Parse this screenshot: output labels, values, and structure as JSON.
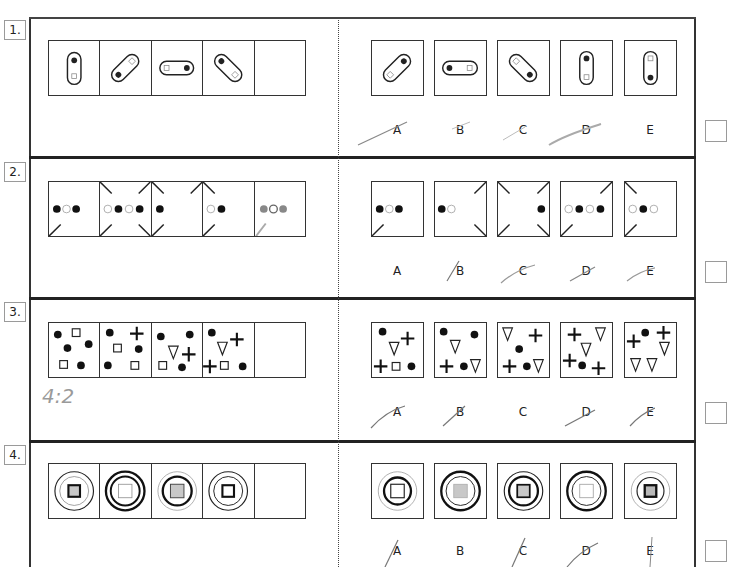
{
  "questions": [
    {
      "number": "1.",
      "sequence": [
        "capsule-vertical dot-top square-bottom",
        "capsule-diagonal-up dot-bottomleft square-topright",
        "capsule-horizontal square-left dot-right",
        "capsule-diagonal-down dot-topleft square-bottomright",
        "empty"
      ],
      "options": [
        {
          "label": "A",
          "figure": "capsule-diagonal-up dot-topright square-bottomleft",
          "crossed_out": true
        },
        {
          "label": "B",
          "figure": "capsule-horizontal dot-left square-right",
          "crossed_out": false
        },
        {
          "label": "C",
          "figure": "capsule-diagonal-down square-topleft dot-bottomright",
          "crossed_out": true
        },
        {
          "label": "D",
          "figure": "capsule-vertical dot-top square-bottom",
          "crossed_out": true
        },
        {
          "label": "E",
          "figure": "capsule-vertical square-top dot-bottom",
          "crossed_out": false
        }
      ],
      "answer": ""
    },
    {
      "number": "2.",
      "sequence": [
        "dots: filled-open-filled, corner ticks bottom-left",
        "dots: open-filled-open-filled, ticks top-left top-right bottom-left bottom-right",
        "dots: filled, ticks top-left top-right bottom-left",
        "dots: open-filled, ticks top-left bottom-left",
        "pencil: filled-open-filled (handwritten)"
      ],
      "options": [
        {
          "label": "A",
          "figure": "dots filled-open-filled, tick bottom-left",
          "crossed_out": false
        },
        {
          "label": "B",
          "figure": "dots filled-open, ticks top-right bottom-right",
          "crossed_out": true
        },
        {
          "label": "C",
          "figure": "dot filled right, ticks all four corners",
          "crossed_out": true
        },
        {
          "label": "D",
          "figure": "dots open-filled-open-filled, ticks top-right bottom-left",
          "crossed_out": true
        },
        {
          "label": "E",
          "figure": "dots open-filled-open, ticks top-left bottom-left",
          "crossed_out": true
        }
      ],
      "answer": ""
    },
    {
      "number": "3.",
      "handwritten_note": "4:2",
      "sequence": [
        "circles x4, squares x2",
        "circles x3, square x2, cross x1",
        "circles x3, triangle x1, cross x1, square x1",
        "circles x2, triangle x1, cross x2, square x1",
        "empty"
      ],
      "options": [
        {
          "label": "A",
          "figure": "circles x2, cross x2, triangle x1, square x1",
          "crossed_out": true
        },
        {
          "label": "B",
          "figure": "circles x3, triangles x2, cross x1",
          "crossed_out": true
        },
        {
          "label": "C",
          "figure": "triangles x2, crosses x2, circles x2",
          "crossed_out": false
        },
        {
          "label": "D",
          "figure": "crosses x3, triangles x2, circle x1",
          "crossed_out": true
        },
        {
          "label": "E",
          "figure": "crosses x2, triangles x3, circle x1",
          "crossed_out": true
        }
      ],
      "answer": ""
    },
    {
      "number": "4.",
      "sequence": [
        "thin outer ring, thin inner ring, grey square thick border",
        "thick outer ring, thick inner ring, white square thin border",
        "thin outer ring, thick inner ring, grey square thin border",
        "thick outer ring, thin inner ring, white square thick border",
        "empty"
      ],
      "options": [
        {
          "label": "A",
          "figure": "thin outer, thick inner, white square thin",
          "crossed_out": true
        },
        {
          "label": "B",
          "figure": "thick outer, thin inner, grey square thin",
          "crossed_out": false
        },
        {
          "label": "C",
          "figure": "thin outer, thick inner, grey square thick",
          "crossed_out": true
        },
        {
          "label": "D",
          "figure": "thick outer, thin inner, white square thin",
          "crossed_out": true
        },
        {
          "label": "E",
          "figure": "thin outer, thin inner, grey square thick",
          "crossed_out": true
        }
      ],
      "answer": ""
    }
  ],
  "colors": {
    "ink": "#222222",
    "grey_fill": "#c8c8c8",
    "pencil": "#9a9a9a",
    "box_border": "#9a9a9a"
  }
}
